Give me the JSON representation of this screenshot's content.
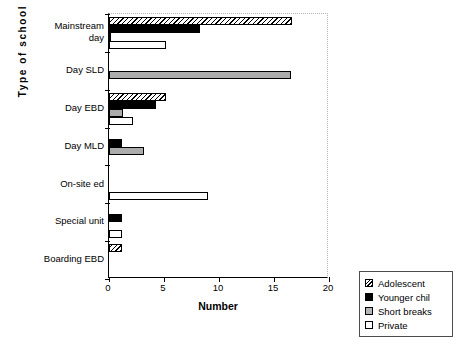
{
  "chart_data": {
    "type": "bar",
    "orientation": "horizontal",
    "title": "",
    "xlabel": "Number",
    "ylabel": "Type  of  school",
    "xlim": [
      0,
      20
    ],
    "xticks": [
      0,
      5,
      10,
      15,
      20
    ],
    "grid": false,
    "legend_position": "bottom-right",
    "categories": [
      "Mainstream day",
      "Day SLD",
      "Day EBD",
      "Day MLD",
      "On-site ed",
      "Special unit",
      "Boarding EBD"
    ],
    "category_label_lines": [
      [
        "Mainstream",
        "day"
      ],
      [
        "Day SLD"
      ],
      [
        "Day EBD"
      ],
      [
        "Day MLD"
      ],
      [
        "On-site ed"
      ],
      [
        "Special unit"
      ],
      [
        "Boarding EBD"
      ]
    ],
    "series": [
      {
        "name": "Adolescent",
        "fill": "diagonal-hatch",
        "color": "#ffffff",
        "values": [
          16.6,
          0,
          5.2,
          0,
          0,
          0,
          1.2
        ]
      },
      {
        "name": "Younger chil",
        "fill": "solid-black",
        "color": "#000000",
        "values": [
          8.3,
          0,
          4.3,
          1.2,
          0,
          1.2,
          0
        ]
      },
      {
        "name": "Short breaks",
        "fill": "gray-checker",
        "color": "#7d7d7d",
        "values": [
          0.15,
          16.5,
          1.3,
          3.2,
          0,
          0,
          0
        ]
      },
      {
        "name": "Private",
        "fill": "white",
        "color": "#ffffff",
        "values": [
          5.2,
          0,
          2.2,
          0,
          9.0,
          1.2,
          0
        ]
      }
    ]
  },
  "legend": {
    "entries": [
      "Adolescent",
      "Younger chil",
      "Short breaks",
      "Private"
    ]
  },
  "axis": {
    "x_title": "Number",
    "y_title": "Type  of  school",
    "x_tick_labels": [
      "0",
      "5",
      "10",
      "15",
      "20"
    ]
  }
}
